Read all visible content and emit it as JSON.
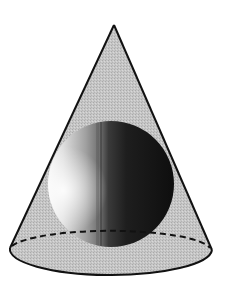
{
  "figure": {
    "colors": {
      "background": "#ffffff",
      "cone_fill": "#c4c4c4",
      "outline": "#111111",
      "sphere_highlight": "#f4f4f4",
      "sphere_mid": "#8a8a8a",
      "sphere_dark": "#141414"
    },
    "cone": {
      "apex": [
        114,
        25
      ],
      "base_center": [
        111,
        250
      ],
      "base_rx": 101,
      "base_ry": 24
    },
    "sphere": {
      "center": [
        111,
        184
      ],
      "radius": 63
    }
  }
}
